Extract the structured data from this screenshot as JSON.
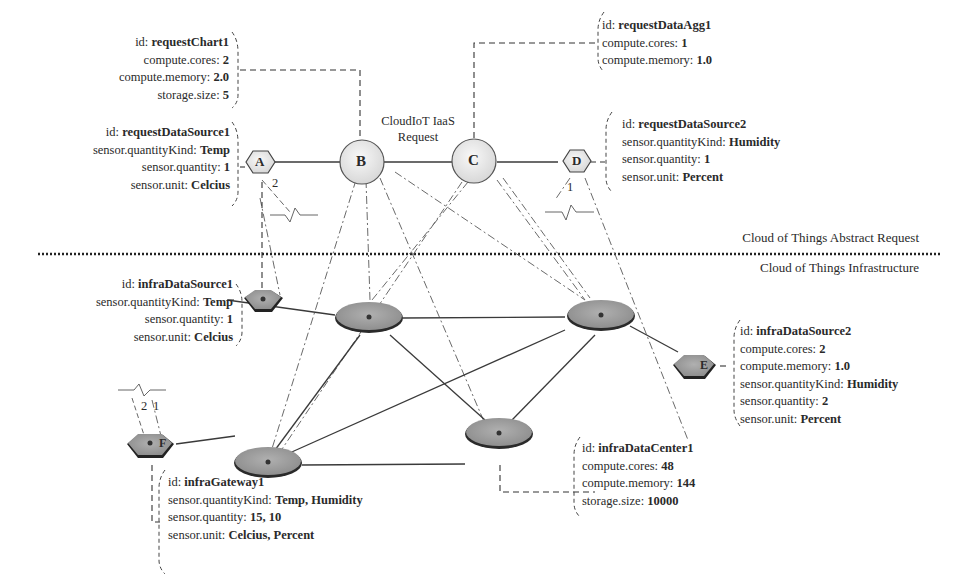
{
  "title": "CloudIoT IaaS Request",
  "title_lines": [
    "CloudIoT IaaS",
    "Request"
  ],
  "layers": {
    "top": "Cloud of Things Abstract Request",
    "bottom": "Cloud of Things Infrastructure"
  },
  "request_nodes": [
    {
      "id": "A",
      "shape": "hexagon"
    },
    {
      "id": "B",
      "shape": "circle"
    },
    {
      "id": "C",
      "shape": "circle"
    },
    {
      "id": "D",
      "shape": "hexagon"
    }
  ],
  "infra_nodes": [
    {
      "id": "E",
      "shape": "hexagon"
    },
    {
      "id": "F",
      "shape": "hexagon"
    }
  ],
  "edge_labels": {
    "a_multiplicity": "2",
    "d_multiplicity": "1",
    "f_multiplicity_left": "2",
    "f_multiplicity_right": "1"
  },
  "annotations": {
    "requestChart1": [
      {
        "key": "id: ",
        "value": "requestChart1"
      },
      {
        "key": "compute.cores: ",
        "value": "2"
      },
      {
        "key": "compute.memory: ",
        "value": "2.0"
      },
      {
        "key": "storage.size: ",
        "value": "5"
      }
    ],
    "requestDataSource1": [
      {
        "key": "id: ",
        "value": "requestDataSource1"
      },
      {
        "key": "sensor.quantityKind: ",
        "value": "Temp"
      },
      {
        "key": "sensor.quantity: ",
        "value": "1"
      },
      {
        "key": "sensor.unit: ",
        "value": "Celcius"
      }
    ],
    "requestDataAgg1": [
      {
        "key": "id: ",
        "value": "requestDataAgg1"
      },
      {
        "key": "compute.cores: ",
        "value": "1"
      },
      {
        "key": "compute.memory: ",
        "value": "1.0"
      }
    ],
    "requestDataSource2": [
      {
        "key": "id: ",
        "value": "requestDataSource2"
      },
      {
        "key": "sensor.quantityKind: ",
        "value": "Humidity"
      },
      {
        "key": "sensor.quantity: ",
        "value": "1"
      },
      {
        "key": "sensor.unit: ",
        "value": "Percent"
      }
    ],
    "infraDataSource1": [
      {
        "key": "id: ",
        "value": "infraDataSource1"
      },
      {
        "key": "sensor.quantityKind: ",
        "value": "Temp"
      },
      {
        "key": "sensor.quantity: ",
        "value": "1"
      },
      {
        "key": "sensor.unit: ",
        "value": "Celcius"
      }
    ],
    "infraDataSource2": [
      {
        "key": "id: ",
        "value": "infraDataSource2"
      },
      {
        "key": "compute.cores: ",
        "value": "2"
      },
      {
        "key": "compute.memory: ",
        "value": "1.0"
      },
      {
        "key": "sensor.quantityKind: ",
        "value": "Humidity"
      },
      {
        "key": "sensor.quantity: ",
        "value": "2"
      },
      {
        "key": "sensor.unit: ",
        "value": "Percent"
      }
    ],
    "infraDataCenter1": [
      {
        "key": "id: ",
        "value": "infraDataCenter1"
      },
      {
        "key": "compute.cores: ",
        "value": "48"
      },
      {
        "key": "compute.memory: ",
        "value": "144"
      },
      {
        "key": "storage.size: ",
        "value": "10000"
      }
    ],
    "infraGateway1": [
      {
        "key": "id: ",
        "value": "infraGateway1"
      },
      {
        "key": "sensor.quantityKind: ",
        "value": "Temp, Humidity"
      },
      {
        "key": "sensor.quantity: ",
        "value": "15, 10"
      },
      {
        "key": "sensor.unit: ",
        "value": "Celcius, Percent"
      }
    ]
  },
  "colors": {
    "request_node_fill": "#ececec",
    "infra_node_fill": "#9a9a9a",
    "line": "#3a3a3a",
    "mapping_line": "#6a6a6a"
  }
}
